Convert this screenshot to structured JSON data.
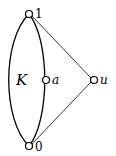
{
  "diagram": {
    "region_label": "K",
    "vertices": [
      {
        "id": "v1",
        "label": "1",
        "x": 29,
        "y": 14
      },
      {
        "id": "v0",
        "label": "0",
        "x": 29,
        "y": 146
      },
      {
        "id": "va",
        "label": "a",
        "x": 46,
        "y": 80
      },
      {
        "id": "vu",
        "label": "u",
        "x": 94,
        "y": 80
      }
    ],
    "edges": [
      {
        "from": "v1",
        "to": "vu"
      },
      {
        "from": "v0",
        "to": "vu"
      }
    ],
    "colors": {
      "stroke": "#000000",
      "fill": "#ffffff"
    }
  }
}
